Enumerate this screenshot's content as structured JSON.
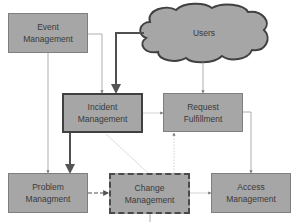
{
  "diagram": {
    "type": "process-flow",
    "nodes": {
      "users": {
        "label": "Users",
        "shape": "cloud"
      },
      "event": {
        "line1": "Event",
        "line2": "Management"
      },
      "incident": {
        "line1": "Incident",
        "line2": "Management"
      },
      "request": {
        "line1": "Request",
        "line2": "Fulfillment"
      },
      "problem": {
        "line1": "Problem",
        "line2": "Managment"
      },
      "change": {
        "line1": "Change",
        "line2": "Management"
      },
      "access": {
        "line1": "Access",
        "line2": "Management"
      }
    },
    "edges": [
      {
        "from": "Event Management",
        "to": "Incident Management",
        "style": "thin"
      },
      {
        "from": "Event Management",
        "to": "Problem Management",
        "style": "thin"
      },
      {
        "from": "Users",
        "to": "Incident Management",
        "style": "thick"
      },
      {
        "from": "Users",
        "to": "Request Fulfillment",
        "style": "thin"
      },
      {
        "from": "Incident Management",
        "to": "Request Fulfillment",
        "style": "faint"
      },
      {
        "from": "Incident Management",
        "to": "Problem Management",
        "style": "thick"
      },
      {
        "from": "Incident Management",
        "to": "Change Management",
        "style": "faint-diagonal"
      },
      {
        "from": "Problem Management",
        "to": "Change Management",
        "style": "dashed"
      },
      {
        "from": "Change Management",
        "to": "Request Fulfillment",
        "style": "dotted"
      },
      {
        "from": "Change Management",
        "to": "Access Management",
        "style": "faint"
      },
      {
        "from": "Request Fulfillment",
        "to": "Access Management",
        "style": "thin"
      }
    ],
    "colors": {
      "node_fill": "#a6a6a6",
      "node_border": "#7f7f7f",
      "emphasis_border": "#404040",
      "line": "#9a9a9a",
      "thick_line": "#555555"
    }
  }
}
